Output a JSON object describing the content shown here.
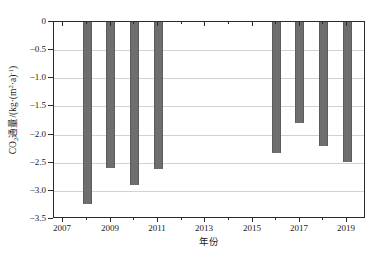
{
  "chart_data": {
    "type": "bar",
    "title": "",
    "subtitle": "",
    "xlabel": "年份",
    "ylabel": "CO₂通量/(kg·(m²·a)⁻¹)",
    "ylabel_parts": {
      "prefix": "CO",
      "sub1": "2",
      "middle": "通量/(kg·(m",
      "sup1": "2",
      "middle2": "·a)",
      "sup2": "-1",
      "suffix": ")"
    },
    "categories": [
      2008,
      2009,
      2010,
      2011,
      2016,
      2017,
      2018,
      2019
    ],
    "values": [
      -3.23,
      -2.59,
      -2.89,
      -2.61,
      -2.32,
      -1.79,
      -2.2,
      -2.48
    ],
    "series": [
      {
        "name": "CO2 flux",
        "values": [
          -3.23,
          -2.59,
          -2.89,
          -2.61,
          -2.32,
          -1.79,
          -2.2,
          -2.48
        ]
      }
    ],
    "missing_years": [
      2007,
      2012,
      2013,
      2014,
      2015
    ],
    "xlim": [
      2006.6,
      2019.8
    ],
    "ylim": [
      -3.5,
      0
    ],
    "x_tick_labels": [
      "2007",
      "2009",
      "2011",
      "2013",
      "2015",
      "2017",
      "2019"
    ],
    "x_tick_values": [
      2007,
      2009,
      2011,
      2013,
      2015,
      2017,
      2019
    ],
    "x_minor_tick_values": [
      2008,
      2010,
      2012,
      2014,
      2016,
      2018
    ],
    "y_tick_labels": [
      "0",
      "−0.5",
      "−1.0",
      "−1.5",
      "−2.0",
      "−2.5",
      "−3.0",
      "−3.5"
    ],
    "y_tick_values": [
      0,
      -0.5,
      -1,
      -1.5,
      -2,
      -2.5,
      -3,
      -3.5
    ],
    "grid": true,
    "grid_axis": "y",
    "legend": false,
    "legend_position": "none",
    "bar_color": "#6e6e6e",
    "grid_color": "#d2d2d2",
    "axis_color": "#2b2b2b",
    "background_color": "#ffffff"
  }
}
